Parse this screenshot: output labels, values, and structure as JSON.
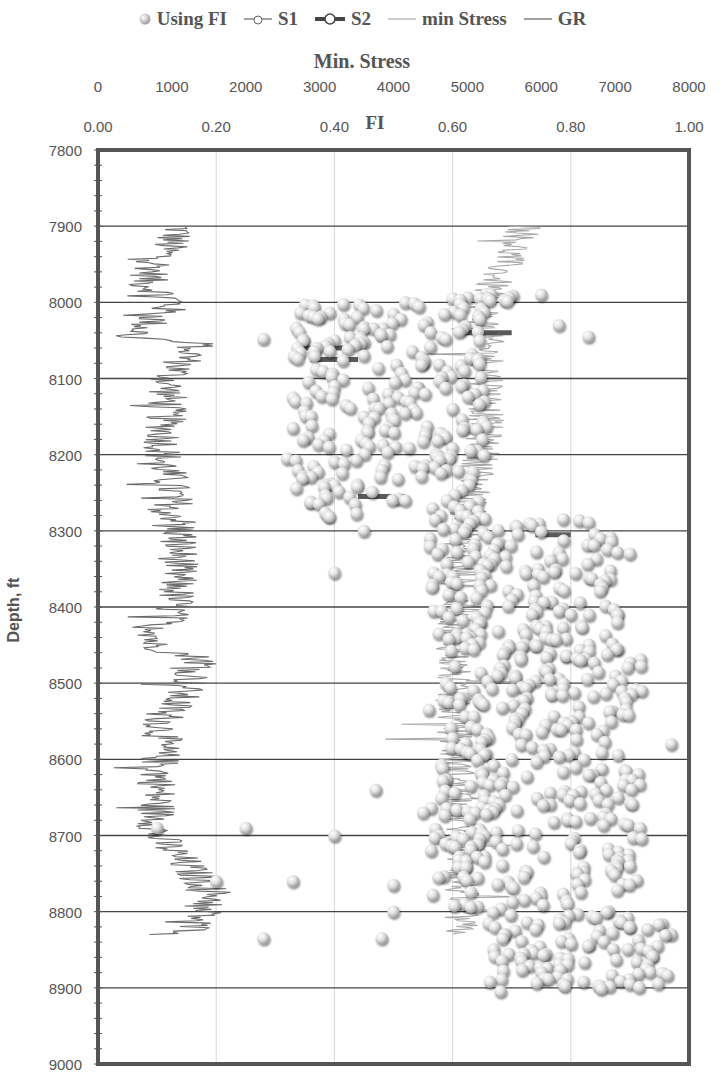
{
  "legend": {
    "items": [
      {
        "label": "Using FI",
        "type": "marker"
      },
      {
        "label": "S1",
        "type": "line-marker-thin"
      },
      {
        "label": "S2",
        "type": "line-marker-thick"
      },
      {
        "label": "min Stress",
        "type": "line-light"
      },
      {
        "label": "GR",
        "type": "line-dark"
      }
    ]
  },
  "axes": {
    "top_stress": {
      "title": "Min. Stress",
      "ticks": [
        "0",
        "1000",
        "2000",
        "3000",
        "4000",
        "5000",
        "6000",
        "7000",
        "8000"
      ]
    },
    "top_fi": {
      "title": "FI",
      "ticks": [
        "0.00",
        "0.20",
        "0.40",
        "0.60",
        "0.80",
        "1.00"
      ]
    },
    "y": {
      "title": "Depth, ft",
      "ticks": [
        "7800",
        "7900",
        "8000",
        "8100",
        "8200",
        "8300",
        "8400",
        "8500",
        "8600",
        "8700",
        "8800",
        "8900",
        "9000"
      ]
    }
  },
  "colors": {
    "frame": "#555555",
    "gridline": "#444444",
    "vgrid": "#d8d8d8",
    "gr_curve": "#6a6a6a",
    "stress_curve": "#a8a8a8",
    "marker_fill": "#e6e6e6",
    "marker_edge": "#9a9a9a",
    "text": "#555555"
  },
  "chart_data": {
    "type": "scatter",
    "title": "",
    "xlabel_top_1": "Min. Stress",
    "xlabel_top_2": "FI",
    "ylabel": "Depth, ft",
    "x_stress_range": [
      0,
      8000
    ],
    "x_fi_range": [
      0.0,
      1.0
    ],
    "ylim": [
      7800,
      9000
    ],
    "y_inverted": true,
    "grid": {
      "horizontal": true,
      "vertical": true
    },
    "legend_position": "top",
    "series": [
      {
        "name": "Using FI",
        "type": "scatter",
        "axis": "FI",
        "depth_range": [
          7985,
          8910
        ],
        "description": "Dense cluster of spherical markers; FI mostly 0.35-0.65 between 8000-8280 ft, shifting to 0.60-0.95 below 8290 ft",
        "points": [
          {
            "depth": 7990,
            "fi": 0.75
          },
          {
            "depth": 7995,
            "fi": 0.6
          },
          {
            "depth": 8000,
            "fi": 0.52
          },
          {
            "depth": 8015,
            "fi": 0.5
          },
          {
            "depth": 8030,
            "fi": 0.78
          },
          {
            "depth": 8045,
            "fi": 0.83
          },
          {
            "depth": 8048,
            "fi": 0.28
          },
          {
            "depth": 8050,
            "fi": 0.4
          },
          {
            "depth": 8060,
            "fi": 0.37
          },
          {
            "depth": 8070,
            "fi": 0.45
          },
          {
            "depth": 8080,
            "fi": 0.55
          },
          {
            "depth": 8090,
            "fi": 0.62
          },
          {
            "depth": 8110,
            "fi": 0.4
          },
          {
            "depth": 8125,
            "fi": 0.33
          },
          {
            "depth": 8140,
            "fi": 0.6
          },
          {
            "depth": 8150,
            "fi": 0.45
          },
          {
            "depth": 8165,
            "fi": 0.33
          },
          {
            "depth": 8180,
            "fi": 0.65
          },
          {
            "depth": 8205,
            "fi": 0.32
          },
          {
            "depth": 8220,
            "fi": 0.48
          },
          {
            "depth": 8240,
            "fi": 0.4
          },
          {
            "depth": 8260,
            "fi": 0.52
          },
          {
            "depth": 8280,
            "fi": 0.58
          },
          {
            "depth": 8290,
            "fi": 0.73
          },
          {
            "depth": 8300,
            "fi": 0.45
          },
          {
            "depth": 8310,
            "fi": 0.85
          },
          {
            "depth": 8330,
            "fi": 0.9
          },
          {
            "depth": 8355,
            "fi": 0.4
          },
          {
            "depth": 8360,
            "fi": 0.6
          },
          {
            "depth": 8370,
            "fi": 0.85
          },
          {
            "depth": 8390,
            "fi": 0.7
          },
          {
            "depth": 8410,
            "fi": 0.8
          },
          {
            "depth": 8450,
            "fi": 0.74
          },
          {
            "depth": 8480,
            "fi": 0.68
          },
          {
            "depth": 8510,
            "fi": 0.92
          },
          {
            "depth": 8535,
            "fi": 0.56
          },
          {
            "depth": 8550,
            "fi": 0.8
          },
          {
            "depth": 8580,
            "fi": 0.97
          },
          {
            "depth": 8600,
            "fi": 0.7
          },
          {
            "depth": 8620,
            "fi": 0.65
          },
          {
            "depth": 8640,
            "fi": 0.47
          },
          {
            "depth": 8650,
            "fi": 0.88
          },
          {
            "depth": 8670,
            "fi": 0.55
          },
          {
            "depth": 8690,
            "fi": 0.1
          },
          {
            "depth": 8690,
            "fi": 0.25
          },
          {
            "depth": 8700,
            "fi": 0.4
          },
          {
            "depth": 8710,
            "fi": 0.8
          },
          {
            "depth": 8740,
            "fi": 0.9
          },
          {
            "depth": 8760,
            "fi": 0.2
          },
          {
            "depth": 8760,
            "fi": 0.33
          },
          {
            "depth": 8765,
            "fi": 0.5
          },
          {
            "depth": 8790,
            "fi": 0.62
          },
          {
            "depth": 8800,
            "fi": 0.5
          },
          {
            "depth": 8815,
            "fi": 0.78
          },
          {
            "depth": 8830,
            "fi": 0.97
          },
          {
            "depth": 8835,
            "fi": 0.28
          },
          {
            "depth": 8835,
            "fi": 0.48
          },
          {
            "depth": 8855,
            "fi": 0.72
          },
          {
            "depth": 8870,
            "fi": 0.93
          },
          {
            "depth": 8895,
            "fi": 0.9
          }
        ]
      },
      {
        "name": "S1",
        "type": "line-with-markers",
        "axis": "FI",
        "description": "Thin line segments overlapping Using FI markers"
      },
      {
        "name": "S2",
        "type": "line-with-markers",
        "axis": "FI",
        "description": "Thick dark line segments around 8055-8075 ft near FI 0.35-0.40"
      },
      {
        "name": "min Stress",
        "type": "line",
        "axis": "Min. Stress",
        "description": "Light gray jagged curve; ~5800 psi at 7900 ft decreasing to ~4900-5000 psi by 8300 ft and staying ~4700-5000 to 8830 ft",
        "points": [
          {
            "depth": 7900,
            "stress": 5800
          },
          {
            "depth": 7950,
            "stress": 5500
          },
          {
            "depth": 8000,
            "stress": 5200
          },
          {
            "depth": 8100,
            "stress": 5300
          },
          {
            "depth": 8200,
            "stress": 5200
          },
          {
            "depth": 8300,
            "stress": 4950
          },
          {
            "depth": 8400,
            "stress": 4850
          },
          {
            "depth": 8500,
            "stress": 4800
          },
          {
            "depth": 8600,
            "stress": 4850
          },
          {
            "depth": 8700,
            "stress": 4950
          },
          {
            "depth": 8800,
            "stress": 4900
          },
          {
            "depth": 8830,
            "stress": 4900
          }
        ]
      },
      {
        "name": "GR",
        "type": "line",
        "axis": "FI-scale position",
        "description": "Dark gray jagged curve on left; x ≈ 0.10-0.15 FI-equivalent, spikes near 8050, 8470, 8790 ft",
        "points": [
          {
            "depth": 7900,
            "x": 0.14
          },
          {
            "depth": 7975,
            "x": 0.08
          },
          {
            "depth": 8000,
            "x": 0.13
          },
          {
            "depth": 8045,
            "x": 0.06
          },
          {
            "depth": 8055,
            "x": 0.17
          },
          {
            "depth": 8100,
            "x": 0.12
          },
          {
            "depth": 8200,
            "x": 0.11
          },
          {
            "depth": 8300,
            "x": 0.14
          },
          {
            "depth": 8400,
            "x": 0.13
          },
          {
            "depth": 8450,
            "x": 0.09
          },
          {
            "depth": 8470,
            "x": 0.18
          },
          {
            "depth": 8550,
            "x": 0.11
          },
          {
            "depth": 8650,
            "x": 0.1
          },
          {
            "depth": 8700,
            "x": 0.1
          },
          {
            "depth": 8780,
            "x": 0.2
          },
          {
            "depth": 8820,
            "x": 0.16
          }
        ]
      }
    ]
  }
}
